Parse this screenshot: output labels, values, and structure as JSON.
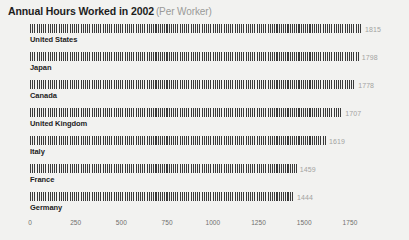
{
  "chart_data": {
    "type": "bar",
    "orientation": "horizontal",
    "title": "Annual Hours Worked in 2002",
    "subtitle": "(Per Worker)",
    "xlabel": "",
    "ylabel": "",
    "categories": [
      "United States",
      "Japan",
      "Canada",
      "United Kingdom",
      "Italy",
      "France",
      "Germany"
    ],
    "values": [
      1815,
      1798,
      1778,
      1707,
      1619,
      1459,
      1444
    ],
    "value_labels": [
      "1815",
      "1798",
      "1778",
      "1707",
      "1619",
      "1459",
      "1444"
    ],
    "xlim": [
      0,
      1900
    ],
    "xticks": [
      0,
      250,
      500,
      750,
      1000,
      1250,
      1500,
      1750
    ],
    "xtick_labels": [
      "0",
      "250",
      "500",
      "750",
      "1000",
      "1250",
      "1500",
      "1750"
    ],
    "grid": false,
    "legend": null,
    "bar_style": "vertical-hatch",
    "colors": {
      "background": "#f2f2f0",
      "bar": "#3a3a3a",
      "title": "#1d1d1d",
      "subtitle": "#9a9a98",
      "category_label": "#1d1d1d",
      "value_label": "#a3a3a1",
      "tick_label": "#6f6f6d"
    }
  }
}
